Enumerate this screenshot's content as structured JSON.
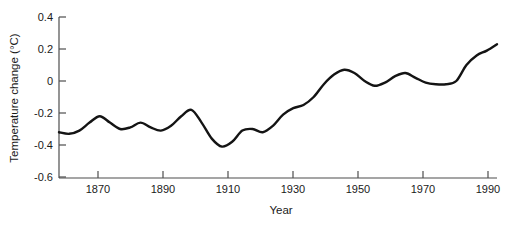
{
  "chart_data": {
    "type": "line",
    "title": "",
    "subtitle": "",
    "xlabel": "Year",
    "ylabel": "Temperature change (°C)",
    "xlim": [
      1861,
      1990
    ],
    "ylim": [
      -0.6,
      0.4
    ],
    "grid": false,
    "legend": null,
    "legend_position": "none",
    "line_color": "#141414",
    "background_color": "#ffffff",
    "axis_color": "#4d4d4d",
    "xticks": [
      1870,
      1890,
      1910,
      1930,
      1950,
      1970,
      1990
    ],
    "xtick_labels": [
      "1870",
      "1890",
      "1910",
      "1930",
      "1950",
      "1970",
      "1990"
    ],
    "yticks": [
      0.4,
      0.2,
      0,
      -0.2,
      -0.4,
      -0.6
    ],
    "ytick_labels": [
      "0.4",
      "0.2",
      "0",
      "-0.2",
      "-0.4",
      "-0.6"
    ],
    "series": [
      {
        "name": "Global temperature change",
        "x": [
          1861,
          1864,
          1867,
          1870,
          1873,
          1876,
          1879,
          1882,
          1885,
          1888,
          1891,
          1894,
          1897,
          1900,
          1903,
          1906,
          1909,
          1912,
          1915,
          1918,
          1921,
          1924,
          1927,
          1930,
          1933,
          1936,
          1939,
          1942,
          1945,
          1948,
          1951,
          1954,
          1957,
          1960,
          1963,
          1966,
          1969,
          1972,
          1975,
          1978,
          1981,
          1984,
          1987,
          1990
        ],
        "values": [
          -0.32,
          -0.33,
          -0.31,
          -0.26,
          -0.22,
          -0.26,
          -0.3,
          -0.29,
          -0.26,
          -0.29,
          -0.31,
          -0.28,
          -0.22,
          -0.18,
          -0.26,
          -0.36,
          -0.41,
          -0.38,
          -0.31,
          -0.3,
          -0.32,
          -0.28,
          -0.21,
          -0.17,
          -0.15,
          -0.1,
          -0.02,
          0.04,
          0.07,
          0.05,
          0.0,
          -0.03,
          -0.01,
          0.03,
          0.05,
          0.02,
          -0.01,
          -0.02,
          -0.02,
          0.0,
          0.1,
          0.16,
          0.19,
          0.23
        ]
      }
    ]
  }
}
